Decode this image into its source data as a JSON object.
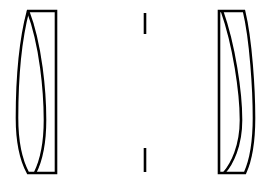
{
  "diagram": {
    "type": "optical-prescription-layout",
    "background_color": "#ffffff",
    "line_color": "#000000",
    "line_width_px": 2.6,
    "canvas": {
      "width": 269,
      "height": 184
    },
    "orientation": "horizontal-optical-axis",
    "element_count": 2,
    "groups": [
      {
        "id": "front-group",
        "name": "front-cemented-doublet",
        "label": "Front doublet",
        "shape_description": "Convex front surface, planar rear surface, internal cemented convex surface",
        "x_left": 17,
        "x_right": 56,
        "y_top": 11,
        "y_bottom": 173,
        "outline_path": "M 56 11 L 28 11 C 19 45, 17 92, 17 118 C 17 143, 22 162, 28 173 L 56 173 Z",
        "cement_path": "M 28 11 C 41 45, 45 92, 45 120 C 45 146, 40 163, 35 173",
        "surfaces": [
          {
            "name": "S1",
            "curvature": "convex-to-left",
            "description": "outer convex front face"
          },
          {
            "name": "S2",
            "curvature": "convex-to-right",
            "description": "internal cemented interface"
          },
          {
            "name": "S3",
            "curvature": "planar",
            "description": "flat rear face"
          }
        ]
      },
      {
        "id": "rear-group",
        "name": "rear-cemented-doublet",
        "label": "Rear doublet",
        "shape_description": "Planar front surface, convex rear surface, internal cemented concave surface",
        "x_left": 219,
        "x_right": 254,
        "y_top": 11,
        "y_bottom": 173,
        "outline_path": "M 219 11 L 244 11 C 251 40, 254 90, 254 118 C 254 144, 250 162, 245 173 L 219 173 Z",
        "cement_path": "M 222 11 C 234 45, 241 92, 241 120 C 241 146, 232 164, 224 173",
        "surfaces": [
          {
            "name": "S4",
            "curvature": "planar",
            "description": "flat front face"
          },
          {
            "name": "S5",
            "curvature": "convex-to-right",
            "description": "internal cemented interface"
          },
          {
            "name": "S6",
            "curvature": "convex-to-right",
            "description": "outer convex rear face"
          }
        ]
      }
    ],
    "aperture_stop": {
      "id": "aperture-stop",
      "name": "aperture-stop",
      "label": "Aperture stop",
      "x": 145,
      "upper_blade": {
        "y_top": 13,
        "y_bottom": 34
      },
      "lower_blade": {
        "y_top": 148,
        "y_bottom": 172
      },
      "clear_aperture_y_top": 34,
      "clear_aperture_y_bottom": 148
    }
  }
}
